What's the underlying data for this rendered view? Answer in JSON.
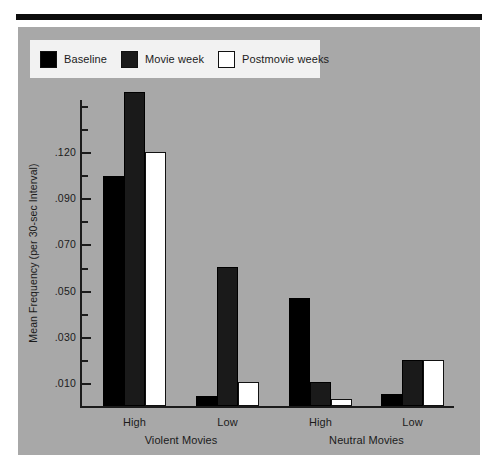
{
  "chart_data": {
    "type": "bar",
    "title": "",
    "xlabel": "",
    "ylabel": "Mean Frequency (per 30-sec Interval)",
    "ylim": [
      0,
      0.135
    ],
    "grid": false,
    "legend_position": "top-left",
    "categories": [
      "High",
      "Low",
      "High",
      "Low"
    ],
    "groups": [
      {
        "name": "Violent Movies",
        "categories": [
          "High",
          "Low"
        ]
      },
      {
        "name": "Neutral Movies",
        "categories": [
          "High",
          "Low"
        ]
      }
    ],
    "y_tick_labels": [
      ".010",
      ".030",
      ".050",
      ".070",
      ".090",
      ".120"
    ],
    "y_tick_values": [
      0.01,
      0.03,
      0.05,
      0.07,
      0.09,
      0.12
    ],
    "series": [
      {
        "name": "Baseline",
        "color": "#000000",
        "values": [
          0.096,
          0.004,
          0.045,
          0.005
        ]
      },
      {
        "name": "Movie week",
        "color": "#1a1a1a",
        "values": [
          0.131,
          0.058,
          0.01,
          0.019
        ]
      },
      {
        "name": "Postmovie weeks",
        "color": "#ffffff",
        "values": [
          0.106,
          0.01,
          0.003,
          0.019
        ]
      }
    ]
  },
  "legend": {
    "items": [
      {
        "label": "Baseline",
        "swatch": "black-swatch"
      },
      {
        "label": "Movie week",
        "swatch": "dark-gray-swatch"
      },
      {
        "label": "Postmovie weeks",
        "swatch": "white-swatch"
      }
    ]
  },
  "axes": {
    "y_title": "Mean Frequency (per 30-sec Interval)",
    "y_labels": [
      ".120",
      ".090",
      ".070",
      ".050",
      ".030",
      ".010"
    ],
    "x_category_labels": [
      "High",
      "Low",
      "High",
      "Low"
    ],
    "x_group_labels": [
      "Violent Movies",
      "Neutral Movies"
    ]
  },
  "colors": {
    "panel_background": "#a8a8a8",
    "page_background": "#ffffff",
    "legend_background": "#f2f2f2",
    "axis": "#1b1b1b",
    "rule": "#0d0d0d"
  }
}
